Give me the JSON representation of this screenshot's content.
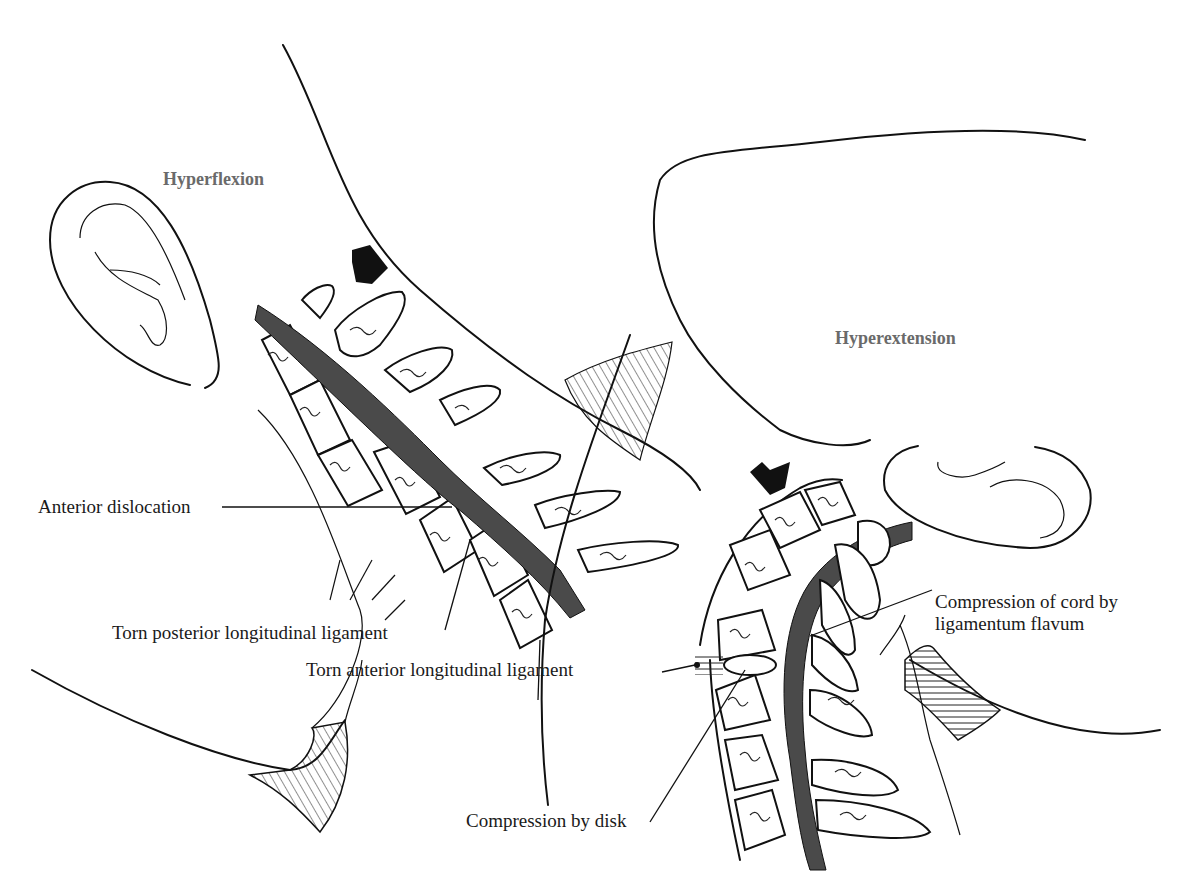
{
  "figure": {
    "panels": [
      {
        "id": "hyperflexion",
        "title": "Hyperflexion",
        "labels": [
          "Anterior dislocation",
          "Torn posterior longitudinal ligament"
        ]
      },
      {
        "id": "hyperextension",
        "title": "Hyperextension",
        "labels": [
          "Torn anterior longitudinal ligament",
          "Compression of cord by",
          "ligamentum flavum",
          "Compression by disk"
        ]
      }
    ],
    "icons": [
      "force-arrow-icon",
      "force-arrow-icon"
    ]
  }
}
